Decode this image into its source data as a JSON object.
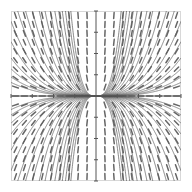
{
  "figure": {
    "type": "slope-field-with-solution-curves",
    "title": "",
    "background_color": "#ffffff",
    "frame_color": "#d8d8d8",
    "axis_color": "#555555",
    "slope_mark_color": "#666666",
    "curve_color": "#5a5a5a",
    "width": 192,
    "height": 192
  },
  "plot_area": {
    "left": 11,
    "top": 11,
    "right": 181,
    "bottom": 181,
    "origin_x": 96,
    "origin_y": 96
  },
  "chart_data": {
    "type": "line",
    "title": "",
    "subtitle": "",
    "xlabel": "",
    "ylabel": "",
    "xlim": [
      -4,
      4
    ],
    "ylim": [
      -4,
      4
    ],
    "grid": false,
    "legend": "none",
    "axes_shown": [
      "x-axis",
      "y-axis"
    ],
    "x_ticks": [
      -4,
      -3,
      -2,
      -1,
      0,
      1,
      2,
      3,
      4
    ],
    "y_ticks": [
      -4,
      -3,
      -2,
      -1,
      0,
      1,
      2,
      3,
      4
    ],
    "x_tick_labels": [],
    "y_tick_labels": [],
    "slope_field": {
      "equation": "dy/dx = 3y/x",
      "grid_columns": 19,
      "grid_rows": 19,
      "mark_length": 6,
      "description": "Short line segments indicating solution slope at each sample point; steeply positive in quadrants I and II, steeply negative in quadrants III and IV."
    },
    "series": [
      {
        "name": "solution curve C=-2.40",
        "constant": -2.4,
        "exponent": 3
      },
      {
        "name": "solution curve C=-1.80",
        "constant": -1.8,
        "exponent": 3
      },
      {
        "name": "solution curve C=-1.35",
        "constant": -1.35,
        "exponent": 3
      },
      {
        "name": "solution curve C=-1.00",
        "constant": -1.0,
        "exponent": 3
      },
      {
        "name": "solution curve C=-0.74",
        "constant": -0.74,
        "exponent": 3
      },
      {
        "name": "solution curve C=-0.55",
        "constant": -0.55,
        "exponent": 3
      },
      {
        "name": "solution curve C=-0.40",
        "constant": -0.4,
        "exponent": 3
      },
      {
        "name": "solution curve C=-0.29",
        "constant": -0.29,
        "exponent": 3
      },
      {
        "name": "solution curve C=-0.21",
        "constant": -0.21,
        "exponent": 3
      },
      {
        "name": "solution curve C=-0.15",
        "constant": -0.15,
        "exponent": 3
      },
      {
        "name": "solution curve C=-0.11",
        "constant": -0.11,
        "exponent": 3
      },
      {
        "name": "solution curve C=-0.08",
        "constant": -0.08,
        "exponent": 3
      },
      {
        "name": "solution curve C=-0.055",
        "constant": -0.055,
        "exponent": 3
      },
      {
        "name": "solution curve C=-0.040",
        "constant": -0.04,
        "exponent": 3
      },
      {
        "name": "solution curve C=-0.028",
        "constant": -0.028,
        "exponent": 3
      },
      {
        "name": "solution curve C=-0.020",
        "constant": -0.02,
        "exponent": 3
      },
      {
        "name": "solution curve C=-0.014",
        "constant": -0.014,
        "exponent": 3
      },
      {
        "name": "solution curve C=-0.010",
        "constant": -0.01,
        "exponent": 3
      },
      {
        "name": "solution curve C=0.010",
        "constant": 0.01,
        "exponent": 3
      },
      {
        "name": "solution curve C=0.014",
        "constant": 0.014,
        "exponent": 3
      },
      {
        "name": "solution curve C=0.020",
        "constant": 0.02,
        "exponent": 3
      },
      {
        "name": "solution curve C=0.028",
        "constant": 0.028,
        "exponent": 3
      },
      {
        "name": "solution curve C=0.040",
        "constant": 0.04,
        "exponent": 3
      },
      {
        "name": "solution curve C=0.055",
        "constant": 0.055,
        "exponent": 3
      },
      {
        "name": "solution curve C=0.08",
        "constant": 0.08,
        "exponent": 3
      },
      {
        "name": "solution curve C=0.11",
        "constant": 0.11,
        "exponent": 3
      },
      {
        "name": "solution curve C=0.15",
        "constant": 0.15,
        "exponent": 3
      },
      {
        "name": "solution curve C=0.21",
        "constant": 0.21,
        "exponent": 3
      },
      {
        "name": "solution curve C=0.29",
        "constant": 0.29,
        "exponent": 3
      },
      {
        "name": "solution curve C=0.40",
        "constant": 0.4,
        "exponent": 3
      },
      {
        "name": "solution curve C=0.55",
        "constant": 0.55,
        "exponent": 3
      },
      {
        "name": "solution curve C=0.74",
        "constant": 0.74,
        "exponent": 3
      },
      {
        "name": "solution curve C=1.00",
        "constant": 1.0,
        "exponent": 3
      },
      {
        "name": "solution curve C=1.35",
        "constant": 1.35,
        "exponent": 3
      },
      {
        "name": "solution curve C=1.80",
        "constant": 1.8,
        "exponent": 3
      },
      {
        "name": "solution curve C=2.40",
        "constant": 2.4,
        "exponent": 3
      }
    ],
    "annotations": [
      "Solution curves converge into a dark cusp along the negative x-axis toward the origin.",
      "Curves fan out steeply in the right half-plane (quadrants I and IV)."
    ]
  }
}
